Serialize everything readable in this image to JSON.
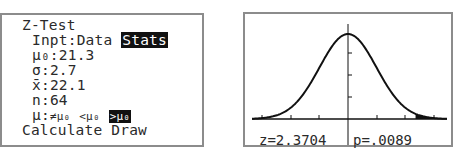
{
  "left_screen": {
    "title": "Z-Test",
    "input": {
      "label": "Inpt:",
      "options": [
        "Data",
        "Stats"
      ],
      "selected": "Stats"
    },
    "mu0": {
      "label": "μ₀:",
      "value": "21.3"
    },
    "sigma": {
      "label": "σ:",
      "value": "2.7"
    },
    "xbar": {
      "label": "x̄:",
      "value": "22.1"
    },
    "n": {
      "label": "n:",
      "value": "64"
    },
    "alternative": {
      "label": "μ:",
      "options": [
        "≠μ₀",
        "<μ₀",
        ">μ₀"
      ],
      "selected": ">μ₀"
    },
    "actions": [
      "Calculate",
      "Draw"
    ]
  },
  "right_screen": {
    "z_label": "z=2.3704",
    "p_label": "p=.0089",
    "curve": "standard-normal",
    "shaded_tail": "right",
    "z": 2.3704,
    "p": 0.0089
  }
}
